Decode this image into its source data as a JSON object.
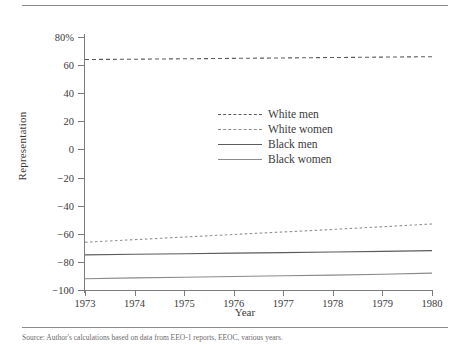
{
  "figure": {
    "xlabel": "Year",
    "ylabel": "Representation",
    "caption": "Source: Author's calculations based on data from EEO-1 reports, EEOC, various years."
  },
  "legend": {
    "position": "inside-center",
    "items": [
      {
        "label": "White men",
        "style": "dashed",
        "color": "#5c5c5c"
      },
      {
        "label": "White women",
        "style": "dotted",
        "color": "#8f8f8f"
      },
      {
        "label": "Black men",
        "style": "solid",
        "color": "#5c5c5c"
      },
      {
        "label": "Black women",
        "style": "solid",
        "color": "#8a8a8a"
      }
    ]
  },
  "axes": {
    "y_ticks": [
      "80%",
      "60",
      "40",
      "20",
      "0",
      "−20",
      "−40",
      "−60",
      "−80",
      "−100"
    ],
    "y_values": [
      80,
      60,
      40,
      20,
      0,
      -20,
      -40,
      -60,
      -80,
      -100
    ],
    "x_ticks": [
      "1973",
      "1974",
      "1975",
      "1976",
      "1977",
      "1978",
      "1979",
      "1980"
    ],
    "x_values": [
      1973,
      1974,
      1975,
      1976,
      1977,
      1978,
      1979,
      1980
    ]
  },
  "chart_data": {
    "type": "line",
    "title": "",
    "xlabel": "Year",
    "ylabel": "Representation",
    "x": [
      1973,
      1974,
      1975,
      1976,
      1977,
      1978,
      1979,
      1980
    ],
    "xlim": [
      1973,
      1980
    ],
    "ylim": [
      -100,
      80
    ],
    "grid": false,
    "legend_position": "inside-center",
    "series": [
      {
        "name": "White men",
        "style": "dashed",
        "color": "#5c5c5c",
        "values": [
          64,
          64.2,
          64.5,
          64.8,
          65.1,
          65.4,
          65.7,
          66
        ]
      },
      {
        "name": "White women",
        "style": "dotted",
        "color": "#8f8f8f",
        "values": [
          -66,
          -64.2,
          -62.3,
          -60.5,
          -58.7,
          -56.9,
          -55,
          -53
        ]
      },
      {
        "name": "Black men",
        "style": "solid",
        "color": "#5c5c5c",
        "values": [
          -75,
          -74.6,
          -74.2,
          -73.8,
          -73.4,
          -73,
          -72.5,
          -72
        ]
      },
      {
        "name": "Black women",
        "style": "solid",
        "color": "#8a8a8a",
        "values": [
          -92,
          -91.4,
          -90.9,
          -90.4,
          -89.9,
          -89.4,
          -88.8,
          -88
        ]
      }
    ]
  }
}
